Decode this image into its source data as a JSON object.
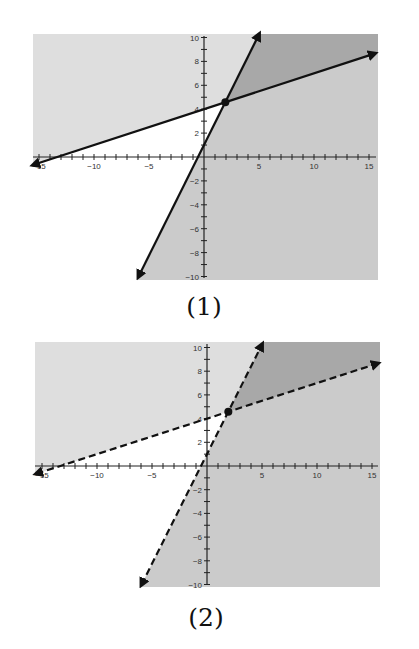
{
  "colors": {
    "background": "#ffffff",
    "shade_above_A": "#dedede",
    "shade_right_B": "#cbcbcb",
    "shade_overlap": "#a8a8a8",
    "line": "#111111",
    "axis": "#222222"
  },
  "chart_data": [
    {
      "type": "line",
      "title": "(1)",
      "caption": "(1)",
      "xlim": [
        -15,
        15
      ],
      "ylim": [
        -10,
        10
      ],
      "x_ticks": [
        -15,
        -10,
        -5,
        5,
        10,
        15
      ],
      "x_tick_labels": [
        "-15",
        "-10",
        "-5",
        "5",
        "10",
        "15"
      ],
      "y_ticks": [
        -10,
        -8,
        -6,
        -4,
        -2,
        2,
        4,
        6,
        8,
        10
      ],
      "y_tick_labels": [
        "-10",
        "-8",
        "-6",
        "-4",
        "-2",
        "2",
        "4",
        "6",
        "8",
        "10"
      ],
      "grid": false,
      "series": [
        {
          "name": "Line A",
          "equation": "y = 0.3x + 4",
          "slope": 0.3,
          "intercept": 4,
          "style": "solid",
          "points": [
            [
              -15.5,
              -0.65
            ],
            [
              15.5,
              8.65
            ]
          ]
        },
        {
          "name": "Line B",
          "equation": "y = 1.85x + 1",
          "slope": 1.85,
          "intercept": 1,
          "style": "solid",
          "points": [
            [
              -5.95,
              -10.0
            ],
            [
              5.0,
              10.25
            ]
          ]
        }
      ],
      "shaded_regions": [
        {
          "name": "above Line A",
          "inequality": "y >= 0.3x + 4",
          "color": "light gray"
        },
        {
          "name": "right of Line B",
          "inequality": "y <= 1.85x + 1",
          "color": "medium gray"
        },
        {
          "name": "solution (overlap)",
          "inequality": "y >= 0.3x + 4 and y <= 1.85x + 1",
          "color": "dark gray"
        }
      ],
      "intersection_point": {
        "x": 1.94,
        "y": 4.58,
        "marker": "filled dot"
      }
    },
    {
      "type": "line",
      "title": "(2)",
      "caption": "(2)",
      "xlim": [
        -15,
        15
      ],
      "ylim": [
        -10,
        10
      ],
      "x_ticks": [
        -15,
        -10,
        -5,
        5,
        10,
        15
      ],
      "x_tick_labels": [
        "-15",
        "-10",
        "-5",
        "5",
        "10",
        "15"
      ],
      "y_ticks": [
        -10,
        -8,
        -6,
        -4,
        -2,
        2,
        4,
        6,
        8,
        10
      ],
      "y_tick_labels": [
        "-10",
        "-8",
        "-6",
        "-4",
        "-2",
        "2",
        "4",
        "6",
        "8",
        "10"
      ],
      "grid": false,
      "series": [
        {
          "name": "Line A",
          "equation": "y = 0.3x + 4",
          "slope": 0.3,
          "intercept": 4,
          "style": "dashed",
          "points": [
            [
              -15.5,
              -0.65
            ],
            [
              15.5,
              8.65
            ]
          ]
        },
        {
          "name": "Line B",
          "equation": "y = 1.85x + 1",
          "slope": 1.85,
          "intercept": 1,
          "style": "dashed",
          "points": [
            [
              -5.95,
              -10.0
            ],
            [
              5.0,
              10.25
            ]
          ]
        }
      ],
      "shaded_regions": [
        {
          "name": "above Line A",
          "inequality": "y > 0.3x + 4",
          "color": "light gray"
        },
        {
          "name": "right of Line B",
          "inequality": "y < 1.85x + 1",
          "color": "medium gray"
        },
        {
          "name": "solution (overlap)",
          "inequality": "y > 0.3x + 4 and y < 1.85x + 1",
          "color": "dark gray"
        }
      ],
      "intersection_point": {
        "x": 1.94,
        "y": 4.58,
        "marker": "filled dot"
      }
    }
  ],
  "figures": [
    {
      "caption": "(1)"
    },
    {
      "caption": "(2)"
    }
  ]
}
